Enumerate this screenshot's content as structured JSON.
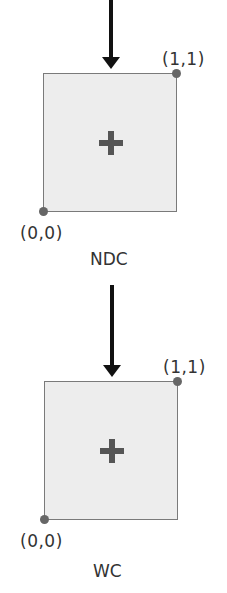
{
  "diagram": {
    "panels": [
      {
        "name": "NDC",
        "label": "NDC",
        "top_right_coord": "(1,1)",
        "bottom_left_coord": "(0,0)",
        "center_marker": "plus-icon"
      },
      {
        "name": "WC",
        "label": "WC",
        "top_right_coord": "(1,1)",
        "bottom_left_coord": "(0,0)",
        "center_marker": "plus-icon"
      }
    ],
    "arrows": [
      {
        "direction": "down",
        "into": "NDC"
      },
      {
        "direction": "down",
        "into": "WC"
      }
    ],
    "colors": {
      "box_fill": "#ededed",
      "box_border": "#7a7a7a",
      "marker": "#555555",
      "dot": "#666666",
      "arrow": "#111111",
      "text": "#333333"
    }
  }
}
